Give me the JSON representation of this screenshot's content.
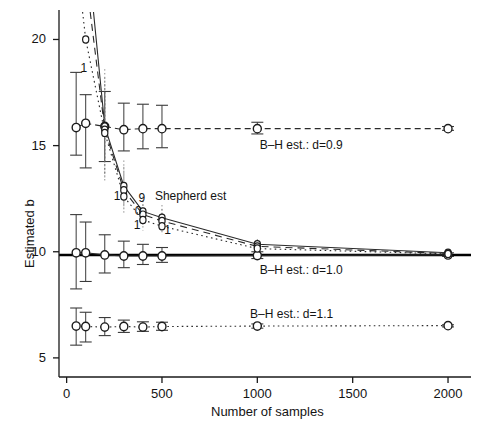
{
  "chart_data": {
    "type": "line",
    "title": "",
    "xlabel": "Number of samples",
    "ylabel": "Estimated b",
    "xlim": [
      -40,
      2110
    ],
    "ylim": [
      4.1,
      21.2
    ],
    "xticks": [
      0,
      500,
      1000,
      1500,
      2000
    ],
    "xticklabels": [
      "0",
      "500",
      "1000",
      "1500",
      "2000"
    ],
    "yticks": [
      5,
      10,
      15,
      20
    ],
    "yticklabels": [
      "5",
      "10",
      "15",
      "20"
    ],
    "grid": false,
    "legend_position": "inline-annotations",
    "reference_line": {
      "label": "true b",
      "value": 9.85
    },
    "x": [
      50,
      100,
      200,
      300,
      400,
      500,
      1000,
      2000
    ],
    "series": [
      {
        "name": "B-H est.: d=0.9",
        "linestyle": "dashed-to-solid",
        "values": [
          15.85,
          16.05,
          15.9,
          15.75,
          15.8,
          15.8,
          15.8,
          15.8
        ],
        "err_low": [
          14.55,
          13.95,
          14.25,
          14.75,
          14.85,
          14.9,
          15.55,
          15.72
        ],
        "err_high": [
          18.45,
          17.4,
          17.55,
          17.0,
          16.95,
          16.9,
          16.1,
          15.9
        ]
      },
      {
        "name": "B-H est.: d=1.0",
        "linestyle": "solid",
        "values": [
          9.95,
          9.95,
          9.85,
          9.8,
          9.8,
          9.8,
          9.82,
          9.85
        ],
        "err_low": [
          8.25,
          8.6,
          9.0,
          9.25,
          9.4,
          9.5,
          9.68,
          9.78
        ],
        "err_high": [
          11.75,
          11.4,
          10.8,
          10.5,
          10.35,
          10.2,
          10.0,
          9.95
        ]
      },
      {
        "name": "B-H est.: d=1.1",
        "linestyle": "dotted",
        "values": [
          6.5,
          6.48,
          6.45,
          6.48,
          6.45,
          6.48,
          6.5,
          6.52
        ],
        "err_low": [
          5.6,
          5.75,
          6.05,
          6.2,
          6.25,
          6.3,
          6.4,
          6.46
        ],
        "err_high": [
          7.35,
          7.15,
          6.9,
          6.78,
          6.7,
          6.68,
          6.6,
          6.56
        ]
      },
      {
        "name": "Shepherd est",
        "linestyle": "solid-steep",
        "values": [
          30.5,
          25.0,
          15.9,
          13.1,
          11.9,
          11.6,
          10.35,
          9.95
        ],
        "err_low": [
          18.0,
          16.5,
          13.6,
          12.2,
          11.3,
          11.1,
          10.15,
          9.88
        ],
        "err_high": [
          45.0,
          36.0,
          18.6,
          14.3,
          12.6,
          12.2,
          10.6,
          10.05
        ]
      },
      {
        "name": "Shepherd est 2",
        "linestyle": "dashed-steep",
        "values": [
          28.0,
          23.0,
          15.75,
          12.9,
          11.75,
          11.45,
          10.25,
          9.92
        ],
        "err_low": [
          17.0,
          15.5,
          13.5,
          12.0,
          11.2,
          11.0,
          10.1,
          9.86
        ],
        "err_high": [
          41.0,
          33.0,
          18.2,
          14.0,
          12.4,
          12.0,
          10.5,
          10.0
        ]
      },
      {
        "name": "Shepherd est 3",
        "linestyle": "dotted-steep",
        "values": [
          24.0,
          20.0,
          15.6,
          12.6,
          11.5,
          11.2,
          10.15,
          9.9
        ],
        "err_low": [
          15.5,
          14.5,
          13.3,
          11.8,
          11.0,
          10.8,
          10.05,
          9.84
        ],
        "err_high": [
          36.0,
          29.0,
          17.9,
          13.7,
          12.1,
          11.7,
          10.35,
          9.98
        ]
      }
    ],
    "annotations": [
      {
        "text": "B–H est.: d=0.9",
        "x": 1230,
        "y": 15.0
      },
      {
        "text": "B–H est.: d=1.0",
        "x": 1230,
        "y": 9.1
      },
      {
        "text": "B–H est.: d=1.1",
        "x": 1180,
        "y": 7.0
      },
      {
        "text": "Shepherd est",
        "x": 650,
        "y": 12.6
      }
    ],
    "point_digit_labels": [
      {
        "text": "1",
        "x": 90,
        "y": 18.6
      },
      {
        "text": "1",
        "x": 265,
        "y": 12.6
      },
      {
        "text": "9",
        "x": 395,
        "y": 12.5
      },
      {
        "text": "0",
        "x": 375,
        "y": 11.85
      },
      {
        "text": "1",
        "x": 370,
        "y": 11.2
      },
      {
        "text": "1",
        "x": 530,
        "y": 11.0
      }
    ]
  },
  "colors": {
    "axis": "#1a1a1a",
    "line": "#2a2a2a",
    "reference": "#000000",
    "marker_edge": "#1c1c1c",
    "text": "#141414"
  }
}
